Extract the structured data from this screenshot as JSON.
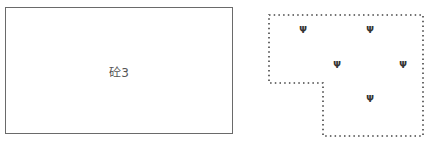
{
  "left_feature": {
    "label": "砼3",
    "border_color": "#6a6a6a"
  },
  "right_feature": {
    "type": "dotted-polygon",
    "symbol": "grass-symbol",
    "symbol_glyph": "Ψ",
    "symbol_count": 5
  }
}
